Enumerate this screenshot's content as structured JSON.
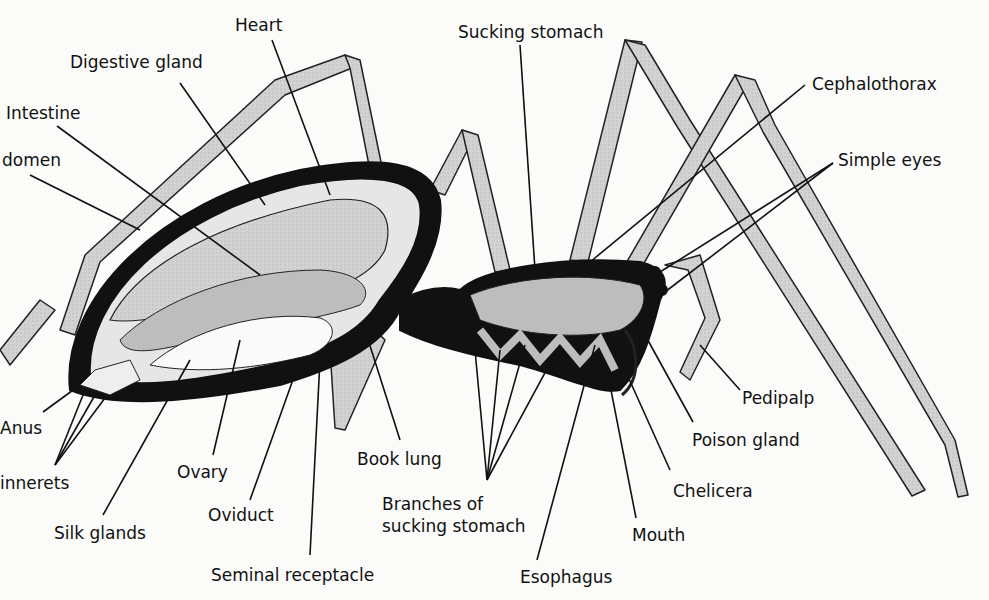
{
  "diagram": {
    "type": "anatomical-cross-section",
    "colors": {
      "background": "#fbfbf9",
      "ink": "#111111",
      "leg_fill": "#cfcfcf",
      "organ_fill": "#bdbdbd"
    },
    "labels": {
      "heart": "Heart",
      "digestive_gland": "Digestive gland",
      "intestine": "Intestine",
      "abdomen": "domen",
      "sucking_stomach": "Sucking stomach",
      "cephalothorax": "Cephalothorax",
      "simple_eyes": "Simple eyes",
      "pedipalp": "Pedipalp",
      "poison_gland": "Poison gland",
      "chelicera": "Chelicera",
      "mouth": "Mouth",
      "esophagus": "Esophagus",
      "branches_line1": "Branches of",
      "branches_line2": "sucking stomach",
      "book_lung": "Book lung",
      "seminal_receptacle": "Seminal receptacle",
      "oviduct": "Oviduct",
      "ovary": "Ovary",
      "silk_glands": "Silk glands",
      "spinnerets": "innerets",
      "anus": "Anus"
    }
  }
}
